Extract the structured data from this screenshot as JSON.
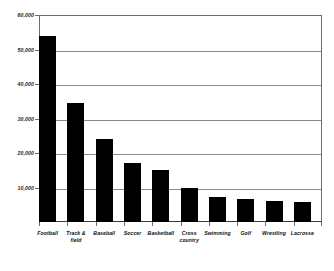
{
  "chart_data": {
    "type": "bar",
    "title": "",
    "xlabel": "",
    "ylabel": "",
    "categories": [
      "Football",
      "Track & field",
      "Baseball",
      "Soccer",
      "Basketball",
      "Cross country",
      "Swimming",
      "Golf",
      "Wrestling",
      "Lacrosse"
    ],
    "values": [
      54000,
      34500,
      24000,
      17000,
      15000,
      10000,
      7300,
      6800,
      6200,
      5700
    ],
    "ylim": [
      0,
      60000
    ],
    "ytick_values": [
      0,
      10000,
      20000,
      30000,
      40000,
      50000,
      60000
    ],
    "ytick_labels": [
      "",
      "10,000",
      "20,000",
      "30,000",
      "40,000",
      "50,000",
      "60,000"
    ],
    "grid": true,
    "legend": false,
    "bar_color": "#000000",
    "grid_color": "#8a8a8a",
    "axis_color": "#6e6e6e"
  },
  "axis": {
    "y_labels": [
      {
        "text": "60,000",
        "value": 60000
      },
      {
        "text": "50,000",
        "value": 50000
      },
      {
        "text": "40,000",
        "value": 40000
      },
      {
        "text": "30,000",
        "value": 30000
      },
      {
        "text": "20,000",
        "value": 20000
      },
      {
        "text": "10,000",
        "value": 10000
      }
    ],
    "x_labels": [
      {
        "text": "Football"
      },
      {
        "text": "Track &\nfield"
      },
      {
        "text": "Baseball"
      },
      {
        "text": "Soccer"
      },
      {
        "text": "Basketball"
      },
      {
        "text": "Cross\ncountry"
      },
      {
        "text": "Swimming"
      },
      {
        "text": "Golf"
      },
      {
        "text": "Wrestling"
      },
      {
        "text": "Lacrosse"
      }
    ]
  }
}
